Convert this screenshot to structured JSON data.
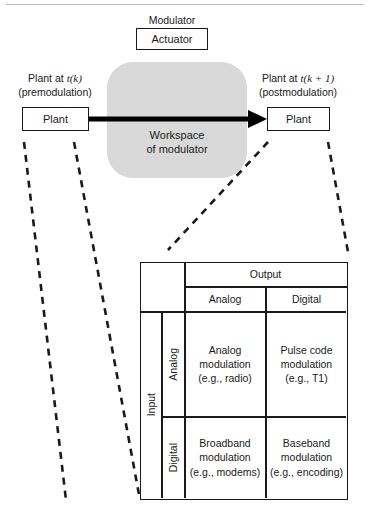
{
  "figure": {
    "modulator": {
      "caption": "Modulator",
      "box_label": "Actuator"
    },
    "workspace": {
      "line1": "Workspace",
      "line2": "of modulator",
      "fill": "#d9d9d9"
    },
    "left_plant": {
      "caption_line1_prefix": "Plant at ",
      "caption_line1_var": "t(k)",
      "caption_line2": "(premodulation)",
      "box_label": "Plant"
    },
    "right_plant": {
      "caption_line1_prefix": "Plant at ",
      "caption_line1_var": "t(k + 1)",
      "caption_line2": "(postmodulation)",
      "box_label": "Plant"
    },
    "arrow": {
      "name": "modulation-arrow",
      "color": "#000000"
    }
  },
  "matrix": {
    "output_header": "Output",
    "input_header": "Input",
    "output_columns": [
      "Analog",
      "Digital"
    ],
    "input_rows": [
      "Analog",
      "Digital"
    ],
    "cells": [
      [
        {
          "line1": "Analog",
          "line2": "modulation",
          "line3": "(e.g., radio)"
        },
        {
          "line1": "Pulse code",
          "line2": "modulation",
          "line3": "(e.g., T1)"
        }
      ],
      [
        {
          "line1": "Broadband",
          "line2": "modulation",
          "line3": "(e.g., modems)"
        },
        {
          "line1": "Baseband",
          "line2": "modulation",
          "line3": "(e.g., encoding)"
        }
      ]
    ]
  }
}
